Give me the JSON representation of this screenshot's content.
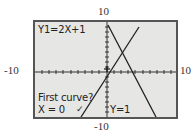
{
  "window_labels": {
    "ymax": "10",
    "ymin": "-10",
    "xmin": "-10",
    "xmax": "10"
  },
  "screen": {
    "equation": "Y1=2X+1",
    "prompt": "First curve?",
    "x_readout": "X = 0",
    "y_readout": "Y=1",
    "cursor_mark": "✓"
  },
  "colors": {
    "screen_bg": "#e6e6e4",
    "frame": "#555555",
    "ink": "#222222"
  }
}
